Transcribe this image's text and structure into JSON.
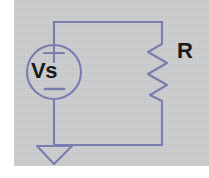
{
  "diagram": {
    "type": "electrical-schematic",
    "background_color": "#c9cacb",
    "wire_color": "#7b7cb0",
    "label_color": "#1a1a1a",
    "components": [
      {
        "id": "voltage-source",
        "symbol": "circle-with-plus-minus",
        "label": "Vs",
        "polarity_top": "+",
        "polarity_bottom": "−",
        "center_x": 54,
        "center_y": 72,
        "radius": 27
      },
      {
        "id": "resistor",
        "symbol": "zigzag",
        "label": "R",
        "x": 162,
        "y_top": 40,
        "y_bottom": 106,
        "zigzag_peaks": 3
      },
      {
        "id": "ground",
        "symbol": "triangle-ground",
        "label": "",
        "x": 54,
        "y": 145
      }
    ],
    "wires": [
      {
        "id": "top-wire",
        "from_x": 54,
        "from_y": 22,
        "to_x": 162,
        "to_y": 22
      },
      {
        "id": "left-upper-wire",
        "from_x": 54,
        "from_y": 22,
        "to_x": 54,
        "to_y": 45
      },
      {
        "id": "left-lower-wire",
        "from_x": 54,
        "from_y": 99,
        "to_x": 54,
        "to_y": 145
      },
      {
        "id": "right-upper-wire",
        "from_x": 162,
        "from_y": 22,
        "to_x": 162,
        "to_y": 40
      },
      {
        "id": "right-lower-wire",
        "from_x": 162,
        "from_y": 106,
        "to_x": 162,
        "to_y": 145
      },
      {
        "id": "bottom-wire",
        "from_x": 54,
        "from_y": 145,
        "to_x": 162,
        "to_y": 145
      }
    ]
  },
  "labels": {
    "source": "Vs",
    "resistor": "R"
  }
}
